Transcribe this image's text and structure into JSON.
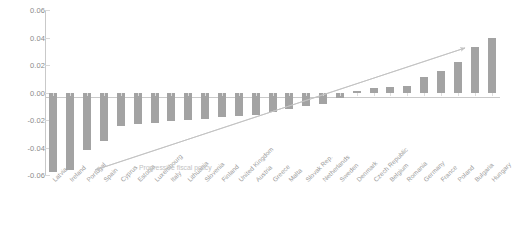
{
  "chart_data": {
    "type": "bar",
    "title": "",
    "subtitle": "",
    "xlabel": "",
    "ylabel": "",
    "ylim": [
      -0.06,
      0.06
    ],
    "grid": true,
    "legend": null,
    "yticks": [
      "0.06",
      "0.04",
      "0.02",
      "0.00",
      "-0.02",
      "-0.04",
      "-0.06"
    ],
    "ytick_values": [
      0.06,
      0.04,
      0.02,
      0.0,
      -0.02,
      -0.04,
      -0.06
    ],
    "categories": [
      "Latvia",
      "Ireland",
      "Portugal",
      "Spain",
      "Cyprus",
      "Estonia",
      "Luxembourg",
      "Italy",
      "Lithuania",
      "Slovenia",
      "Finland",
      "United Kingdom",
      "Austria",
      "Greece",
      "Malta",
      "Slovak Rep.",
      "Netherlands",
      "Sweden",
      "Denmark",
      "Czech Republic",
      "Belgium",
      "Romania",
      "Germany",
      "France",
      "Poland",
      "Bulgaria",
      "Hungary"
    ],
    "values": [
      -0.058,
      -0.056,
      -0.042,
      -0.035,
      -0.024,
      -0.023,
      -0.022,
      -0.021,
      -0.02,
      -0.019,
      -0.018,
      -0.017,
      -0.016,
      -0.014,
      -0.012,
      -0.01,
      -0.008,
      -0.004,
      0.001,
      0.003,
      0.004,
      0.005,
      0.011,
      0.016,
      0.022,
      0.033,
      0.04
    ],
    "annotations": [
      {
        "text": "Progressive fiscal policy",
        "type": "double-headed-arrow",
        "direction": "up-right"
      }
    ],
    "colors": {
      "bar": "#a3a3a3",
      "axis": "#c9c9c9",
      "grid": "#d8d8d8",
      "tick_text": "#8a8a8a",
      "category_text": "#9b9b9b",
      "annotation": "#c2c2c2",
      "background": "#ffffff"
    }
  }
}
